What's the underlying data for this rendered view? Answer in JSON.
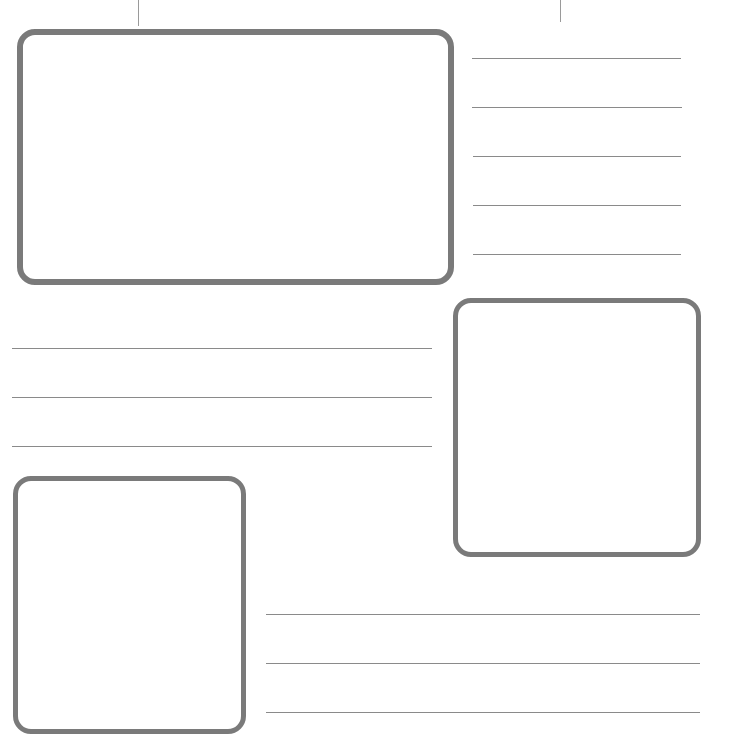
{
  "page": {
    "type": "worksheet-template",
    "border_color": "#7a7a7a",
    "line_color": "#8a8a8a",
    "background": "#ffffff"
  },
  "frames": [
    {
      "id": "frame-top-left",
      "x": 17,
      "y": 29,
      "w": 437,
      "h": 256
    },
    {
      "id": "frame-middle-right",
      "x": 453,
      "y": 298,
      "w": 248,
      "h": 259
    },
    {
      "id": "frame-bottom-left",
      "x": 13,
      "y": 476,
      "w": 233,
      "h": 258
    }
  ],
  "line_groups": [
    {
      "id": "lines-top-right",
      "count": 5
    },
    {
      "id": "lines-middle-left",
      "count": 3
    },
    {
      "id": "lines-bottom-right",
      "count": 3
    }
  ]
}
